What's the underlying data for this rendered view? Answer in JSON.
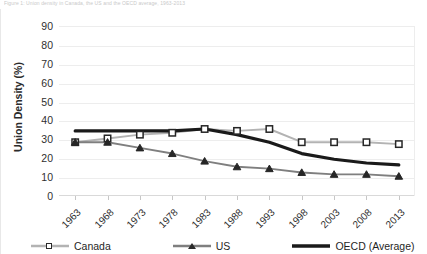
{
  "caption": "Figure 1: Union density in Canada, the US and the OECD average, 1963-2013",
  "chart_data": {
    "type": "line",
    "title": "",
    "xlabel": "",
    "ylabel": "Union Density (%)",
    "ylim": [
      0,
      90
    ],
    "ytick_step": 10,
    "yticks": [
      90,
      80,
      70,
      60,
      50,
      40,
      30,
      20,
      10,
      0
    ],
    "grid": true,
    "legend_position": "bottom",
    "categories": [
      "1963",
      "1968",
      "1973",
      "1978",
      "1983",
      "1988",
      "1993",
      "1998",
      "2003",
      "2008",
      "2013"
    ],
    "series": [
      {
        "name": "Canada",
        "color": "#b3b3b3",
        "marker": "square",
        "marker_color": "#ffffff",
        "marker_edge": "#262626",
        "values": [
          29,
          31,
          33,
          34,
          36,
          35,
          36,
          29,
          29,
          29,
          28
        ]
      },
      {
        "name": "US",
        "color": "#7f7f7f",
        "marker": "triangle",
        "marker_color": "#262626",
        "marker_edge": "#262626",
        "values": [
          29,
          29,
          26,
          23,
          19,
          16,
          15,
          13,
          12,
          12,
          11
        ]
      },
      {
        "name": "OECD (Average)",
        "color": "#1a1a1a",
        "marker": "none",
        "values": [
          35,
          35,
          35,
          35,
          36,
          33,
          29,
          23,
          20,
          18,
          17
        ]
      }
    ]
  },
  "legend": {
    "items": [
      {
        "label": "Canada"
      },
      {
        "label": "US"
      },
      {
        "label": "OECD (Average)"
      }
    ]
  }
}
